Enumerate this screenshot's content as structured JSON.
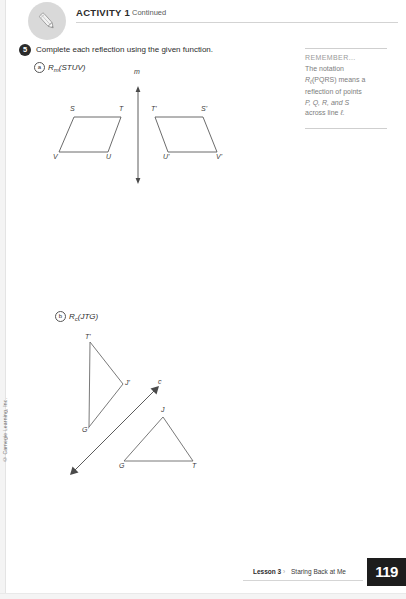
{
  "header": {
    "icon": "pencil-icon",
    "activity": "ACTIVITY 1",
    "continued": "Continued"
  },
  "question": {
    "number": "5",
    "prompt": "Complete each reflection using the given function.",
    "parts": [
      {
        "marker": "a",
        "notation_main": "R",
        "notation_sub": "m",
        "notation_args": "(STUV)"
      },
      {
        "marker": "b",
        "notation_main": "R",
        "notation_sub": "c",
        "notation_args": "(JTG)"
      }
    ]
  },
  "remember": {
    "heading": "REMEMBER...",
    "line1": "The notation",
    "line2_pre": "R",
    "line2_sub": "ℓ",
    "line2_post": "(PQRS) means a",
    "line3": "reflection of points",
    "line4": "P, Q, R, and S",
    "line5_pre": "across line ",
    "line5_line": "ℓ."
  },
  "figure_a": {
    "name": "parallelogram-reflection-diagram",
    "line_label": "m",
    "preimage_labels": [
      "S",
      "T",
      "U",
      "V"
    ],
    "image_labels": [
      "T'",
      "S'",
      "V'",
      "U'"
    ]
  },
  "figure_b": {
    "name": "triangle-reflection-diagram",
    "line_label": "c",
    "preimage_labels": [
      "J",
      "G",
      "T"
    ],
    "image_labels": [
      "T'",
      "J'",
      "G'"
    ]
  },
  "footer": {
    "lesson": "Lesson 3",
    "separator": "›",
    "title": "Staring Back at Me",
    "page_number": "119"
  },
  "copyright": "© Carnegie Learning, Inc.",
  "colors": {
    "ink": "#3a3a3a",
    "badge_gray": "#d9d9d9",
    "remember_gray": "#7d7d7d",
    "page_box": "#1d1d1d"
  }
}
